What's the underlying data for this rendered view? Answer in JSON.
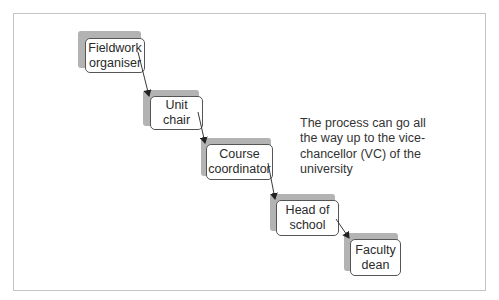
{
  "diagram": {
    "type": "escalation-flow",
    "nodes": [
      {
        "id": "fieldwork-organiser",
        "label": "Fieldwork\norganiser"
      },
      {
        "id": "unit-chair",
        "label": "Unit\nchair"
      },
      {
        "id": "course-coordinator",
        "label": "Course\ncoordinator"
      },
      {
        "id": "head-of-school",
        "label": "Head of\nschool"
      },
      {
        "id": "faculty-dean",
        "label": "Faculty\ndean"
      }
    ],
    "edges": [
      {
        "from": "fieldwork-organiser",
        "to": "unit-chair"
      },
      {
        "from": "unit-chair",
        "to": "course-coordinator"
      },
      {
        "from": "course-coordinator",
        "to": "head-of-school"
      },
      {
        "from": "head-of-school",
        "to": "faculty-dean"
      }
    ],
    "annotation": "The process can go all the way up to the vice-chancellor (VC) of the university"
  },
  "colors": {
    "shadow": "#b3b3b3",
    "node_border": "#555555",
    "frame_border": "#c4c4c4",
    "arrow": "#222222"
  }
}
